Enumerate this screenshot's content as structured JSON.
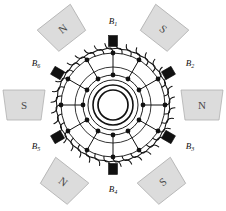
{
  "figure": {
    "type": "electrical-machine-diagram",
    "width": 226,
    "height": 211,
    "background_color": "#ffffff",
    "ink_color": "#111111"
  },
  "poles": [
    {
      "id": "pole-top-left",
      "label": "N",
      "angle_deg": 120,
      "cx": 63,
      "cy": 29,
      "rotation": -38,
      "fill": "#dcdcdc",
      "stroke": "#b0b0b0"
    },
    {
      "id": "pole-top-right",
      "label": "S",
      "angle_deg": 60,
      "cx": 163,
      "cy": 29,
      "rotation": 38,
      "fill": "#dcdcdc",
      "stroke": "#b0b0b0"
    },
    {
      "id": "pole-left",
      "label": "S",
      "angle_deg": 180,
      "cx": 24,
      "cy": 105,
      "rotation": 0,
      "fill": "#dcdcdc",
      "stroke": "#b0b0b0"
    },
    {
      "id": "pole-right",
      "label": "N",
      "angle_deg": 0,
      "cx": 202,
      "cy": 105,
      "rotation": 0,
      "fill": "#dcdcdc",
      "stroke": "#b0b0b0"
    },
    {
      "id": "pole-bottom-left",
      "label": "N",
      "angle_deg": 240,
      "cx": 63,
      "cy": 182,
      "rotation": 38,
      "fill": "#dcdcdc",
      "stroke": "#b0b0b0"
    },
    {
      "id": "pole-bottom-right",
      "label": "S",
      "angle_deg": 300,
      "cx": 163,
      "cy": 182,
      "rotation": -38,
      "fill": "#dcdcdc",
      "stroke": "#b0b0b0"
    }
  ],
  "brushes": [
    {
      "id": "brush-1",
      "label": "B",
      "subscript": "1",
      "angle_deg": 90,
      "label_x": 113,
      "label_y": 22
    },
    {
      "id": "brush-2",
      "label": "B",
      "subscript": "2",
      "angle_deg": 30,
      "label_x": 190,
      "label_y": 64
    },
    {
      "id": "brush-3",
      "label": "B",
      "subscript": "3",
      "angle_deg": 330,
      "label_x": 190,
      "label_y": 147
    },
    {
      "id": "brush-4",
      "label": "B",
      "subscript": "4",
      "angle_deg": 270,
      "label_x": 113,
      "label_y": 190
    },
    {
      "id": "brush-5",
      "label": "B",
      "subscript": "5",
      "angle_deg": 210,
      "label_x": 36,
      "label_y": 147
    },
    {
      "id": "brush-6",
      "label": "B",
      "subscript": "6",
      "angle_deg": 150,
      "label_x": 36,
      "label_y": 64
    }
  ],
  "armature": {
    "center_x": 113,
    "center_y": 105,
    "outer_coil_radius": 62,
    "ring_radius": 52,
    "tap_ring_radius": 38,
    "commutator_outer_radius": 30,
    "commutator_mid_radius": 25,
    "commutator_inner_radius": 20,
    "shaft_radius": 15,
    "coil_loop_count": 36,
    "tap_count": 12,
    "segment_count": 12
  },
  "caption": {
    "text": "",
    "visible": false
  }
}
